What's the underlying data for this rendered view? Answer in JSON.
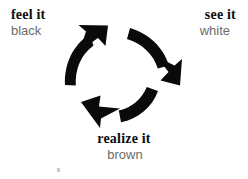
{
  "diagram": {
    "type": "cycle",
    "background_color": "#ffffff",
    "direction": "clockwise",
    "nodes": [
      {
        "id": "feel",
        "title": "feel it",
        "subtitle": "black",
        "position": "top-left",
        "title_color": "#0d0d0d",
        "subtitle_color": "#6b6b6b"
      },
      {
        "id": "see",
        "title": "see it",
        "subtitle": "white",
        "position": "top-right",
        "title_color": "#0d0d0d",
        "subtitle_color": "#6b6b6b"
      },
      {
        "id": "realize",
        "title": "realize it",
        "subtitle": "brown",
        "position": "bottom-center",
        "title_color": "#0d0d0d",
        "subtitle_color": "#6b6b6b"
      }
    ],
    "arrows": [
      {
        "id": "arrow-to-feel",
        "from": "realize",
        "to": "feel",
        "head_direction": "north-east",
        "color": "#0a0a0a"
      },
      {
        "id": "arrow-to-realize",
        "from": "see",
        "to": "realize",
        "head_direction": "south-east",
        "color": "#0a0a0a"
      },
      {
        "id": "arrow-to-see",
        "from": "feel",
        "to": "see",
        "head_direction": "north-west",
        "color": "#0a0a0a"
      }
    ],
    "artifact": {
      "id": "speck",
      "description": "tiny faint gray speck near bottom-left",
      "color": "#c9c9c9"
    }
  }
}
